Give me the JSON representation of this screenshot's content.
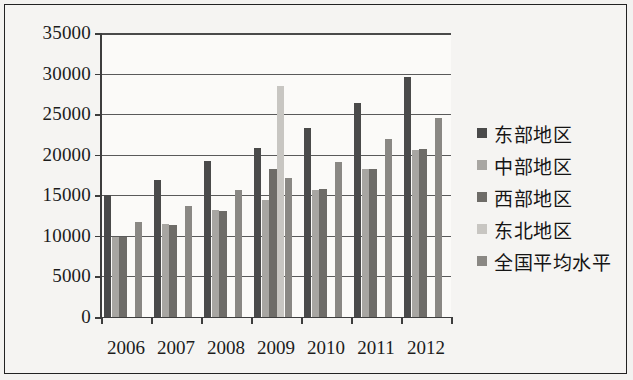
{
  "chart_data": {
    "type": "bar",
    "title": "",
    "xlabel": "",
    "ylabel": "",
    "categories": [
      "2006",
      "2007",
      "2008",
      "2009",
      "2010",
      "2011",
      "2012"
    ],
    "ylim": [
      0,
      35000
    ],
    "ytick_values": [
      0,
      5000,
      10000,
      15000,
      20000,
      25000,
      30000,
      35000
    ],
    "ytick_labels": [
      "0",
      "5000",
      "10000",
      "15000",
      "20000",
      "25000",
      "30000",
      "35000"
    ],
    "grid": true,
    "legend_position": "right",
    "series": [
      {
        "name": "东部地区",
        "color": "#4a4a4a",
        "values": [
          15000,
          16900,
          19200,
          20800,
          23300,
          26400,
          29600
        ]
      },
      {
        "name": "中部地区",
        "color": "#a8a6a2",
        "values": [
          9800,
          11500,
          13200,
          14400,
          15700,
          18200,
          20600
        ]
      },
      {
        "name": "西部地区",
        "color": "#6e6c68",
        "values": [
          9900,
          11400,
          13100,
          18300,
          15800,
          18300,
          20700
        ]
      },
      {
        "name": "东北地区",
        "color": "#c8c6c2",
        "values": [
          0,
          0,
          0,
          28500,
          0,
          0,
          0
        ]
      },
      {
        "name": "全国平均水平",
        "color": "#8a8884",
        "values": [
          11700,
          13700,
          15700,
          17100,
          19100,
          21900,
          24500
        ]
      }
    ]
  },
  "legend": {
    "items": [
      {
        "label": "东部地区",
        "swatch": "#4a4a4a"
      },
      {
        "label": "中部地区",
        "swatch": "#a8a6a2"
      },
      {
        "label": "西部地区",
        "swatch": "#6e6c68"
      },
      {
        "label": "东北地区",
        "swatch": "#c8c6c2"
      },
      {
        "label": "全国平均水平",
        "swatch": "#8a8884"
      }
    ]
  }
}
